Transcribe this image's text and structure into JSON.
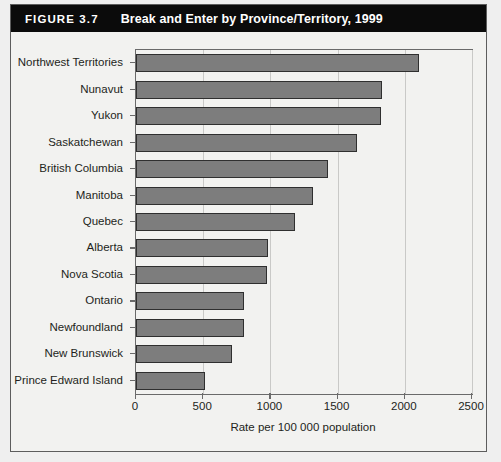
{
  "figure": {
    "number": "FIGURE 3.7",
    "title": "Break and Enter by Province/Territory, 1999"
  },
  "colors": {
    "title_bar_bg": "#0b0b0b",
    "title_text": "#ffffff",
    "bar_fill": "#7d7d7d",
    "bar_border": "#2f2f2f",
    "axis": "#6a6a6a",
    "grid": "#c9c9c7",
    "page_bg": "#f2f2f0"
  },
  "chart_data": {
    "type": "bar",
    "orientation": "horizontal",
    "title": "Break and Enter by Province/Territory, 1999",
    "xlabel": "Rate per 100 000 population",
    "ylabel": "",
    "xlim": [
      0,
      2500
    ],
    "xticks": [
      0,
      500,
      1000,
      1500,
      2000,
      2500
    ],
    "xtick_labels": [
      "0",
      "500",
      "1000",
      "1500",
      "2000",
      "2500"
    ],
    "grid": true,
    "legend": null,
    "categories": [
      "Northwest Territories",
      "Nunavut",
      "Yukon",
      "Saskatchewan",
      "British Columbia",
      "Manitoba",
      "Quebec",
      "Alberta",
      "Nova Scotia",
      "Ontario",
      "Newfoundland",
      "New Brunswick",
      "Prince Edward Island"
    ],
    "values": [
      2105,
      1830,
      1820,
      1645,
      1430,
      1315,
      1185,
      985,
      975,
      805,
      805,
      715,
      515
    ]
  }
}
